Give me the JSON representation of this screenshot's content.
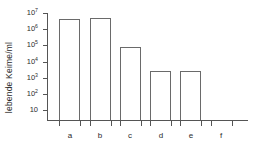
{
  "chart_data": {
    "type": "bar",
    "title": "",
    "subtitle": "",
    "xlabel": "",
    "ylabel": "lebende Keime/ml",
    "yscale": "log",
    "ylim": [
      10,
      10000000
    ],
    "grid": false,
    "legend": null,
    "categories": [
      "a",
      "b",
      "c",
      "d",
      "e",
      "f"
    ],
    "values": [
      4500000,
      4600000,
      80000,
      2500,
      2500,
      0
    ],
    "bars": [
      {
        "category": "a",
        "value": 4500000,
        "has_bar": true
      },
      {
        "category": "b",
        "value": 4600000,
        "has_bar": true
      },
      {
        "category": "c",
        "value": 80000,
        "has_bar": true
      },
      {
        "category": "d",
        "value": 2500,
        "has_bar": true
      },
      {
        "category": "e",
        "value": 2500,
        "has_bar": true
      },
      {
        "category": "f",
        "value": 0,
        "has_bar": false
      }
    ],
    "ytick_values": [
      10,
      100,
      1000,
      10000,
      100000,
      1000000,
      10000000
    ],
    "ytick_labels": [
      "10",
      "10 2",
      "10 3",
      "10 4",
      "10 5",
      "10 6",
      "10 7"
    ],
    "ytick_mantissa": [
      "10",
      "10",
      "10",
      "10",
      "10",
      "10",
      "10"
    ],
    "ytick_exponent": [
      "",
      "2",
      "3",
      "4",
      "5",
      "6",
      "7"
    ],
    "axis_color": "#555555",
    "bar_edge_color": "#6a6a6a",
    "bar_fill_color": "transparent",
    "background_color": "#ffffff",
    "text_color": "#2b2b2b"
  }
}
